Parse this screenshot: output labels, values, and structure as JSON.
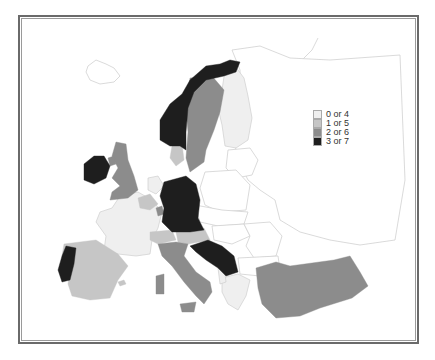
{
  "legend": {
    "items": [
      {
        "label": "0 or 4",
        "color": "#efefef"
      },
      {
        "label": "1 or 5",
        "color": "#c6c6c6"
      },
      {
        "label": "2 or 6",
        "color": "#8c8c8c"
      },
      {
        "label": "3 or 7",
        "color": "#1e1e1e"
      }
    ]
  },
  "map": {
    "region": "Europe",
    "outline_color": "#d0d0d0",
    "countries": [
      {
        "name": "Norway",
        "class": "3 or 7"
      },
      {
        "name": "Sweden",
        "class": "2 or 6"
      },
      {
        "name": "Finland",
        "class": "0 or 4"
      },
      {
        "name": "Denmark",
        "class": "1 or 5"
      },
      {
        "name": "Ireland",
        "class": "3 or 7"
      },
      {
        "name": "United Kingdom",
        "class": "2 or 6"
      },
      {
        "name": "France",
        "class": "0 or 4"
      },
      {
        "name": "Belgium",
        "class": "1 or 5"
      },
      {
        "name": "Netherlands",
        "class": "0 or 4"
      },
      {
        "name": "Luxembourg",
        "class": "2 or 6"
      },
      {
        "name": "Germany",
        "class": "3 or 7"
      },
      {
        "name": "Switzerland",
        "class": "1 or 5"
      },
      {
        "name": "Austria",
        "class": "1 or 5"
      },
      {
        "name": "Italy",
        "class": "2 or 6"
      },
      {
        "name": "Yugoslavia",
        "class": "3 or 7"
      },
      {
        "name": "Greece",
        "class": "0 or 4"
      },
      {
        "name": "Albania",
        "class": "0 or 4"
      },
      {
        "name": "Spain",
        "class": "1 or 5"
      },
      {
        "name": "Portugal",
        "class": "3 or 7"
      },
      {
        "name": "Turkey",
        "class": "2 or 6"
      },
      {
        "name": "Iceland",
        "class": "no data"
      },
      {
        "name": "Poland",
        "class": "no data"
      },
      {
        "name": "Czechoslovakia",
        "class": "no data"
      },
      {
        "name": "Hungary",
        "class": "no data"
      },
      {
        "name": "Romania",
        "class": "no data"
      },
      {
        "name": "Bulgaria",
        "class": "no data"
      },
      {
        "name": "USSR",
        "class": "no data"
      }
    ]
  }
}
